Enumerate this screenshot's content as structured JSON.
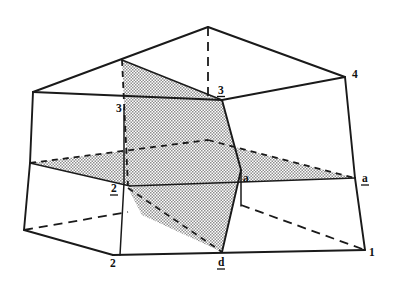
{
  "figure": {
    "background_color": "#ffffff",
    "line_color": "#1a1a1a",
    "shade_color": "#9a9a9a",
    "labels": [
      {
        "id": "label-4",
        "text": "4",
        "underlined": false,
        "x": 352,
        "y": 78,
        "anchor": "start"
      },
      {
        "id": "label-3-upper",
        "text": "3",
        "underlined": true,
        "x": 218,
        "y": 94,
        "anchor": "start"
      },
      {
        "id": "label-3-left",
        "text": "3",
        "underlined": false,
        "x": 116,
        "y": 112,
        "anchor": "start"
      },
      {
        "id": "label-a-right",
        "text": "a",
        "underlined": true,
        "x": 362,
        "y": 182,
        "anchor": "start"
      },
      {
        "id": "label-a-center",
        "text": "a",
        "underlined": false,
        "x": 243,
        "y": 182,
        "anchor": "start"
      },
      {
        "id": "label-2-left",
        "text": "2",
        "underlined": true,
        "x": 111,
        "y": 192,
        "anchor": "start"
      },
      {
        "id": "label-2-bottom",
        "text": "2",
        "underlined": false,
        "x": 110,
        "y": 267,
        "anchor": "start"
      },
      {
        "id": "label-d-bottom",
        "text": "d",
        "underlined": true,
        "x": 218,
        "y": 266,
        "anchor": "start"
      },
      {
        "id": "label-1",
        "text": "1",
        "underlined": false,
        "x": 369,
        "y": 256,
        "anchor": "start"
      }
    ],
    "vertices": {
      "apex_top": [
        208,
        27
      ],
      "top_left": [
        33,
        92
      ],
      "top_right": [
        345,
        77
      ],
      "left_mid": [
        30,
        163
      ],
      "left_bottom": [
        24,
        230
      ],
      "bottom_mid_left": [
        113,
        255
      ],
      "bottom_right": [
        365,
        250
      ],
      "right_mid": [
        355,
        178
      ],
      "center_node": [
        241,
        170
      ],
      "upper_node_3": [
        222,
        100
      ],
      "left_edge_3": [
        124,
        108
      ],
      "left_edge_2": [
        124,
        183
      ],
      "plane_top_left": [
        122,
        60
      ],
      "plane_bot_d": [
        222,
        252
      ]
    },
    "shaded_planes": [
      {
        "name": "horizontal-plane",
        "description": "flat stippled plane through the middle of the block"
      },
      {
        "name": "vertical-plane",
        "description": "inclined stippled plane cutting the block front to back"
      }
    ]
  }
}
